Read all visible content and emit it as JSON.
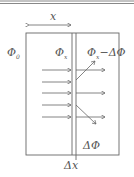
{
  "diagram": {
    "labels": {
      "x": "x",
      "phi0": "Φ",
      "phi0_sub": "0",
      "phix": "Φ",
      "phix_sub": "x",
      "phix_minus": "Φ",
      "phix_minus_sub": "x",
      "phix_minus_rest": "−ΔΦ",
      "delta_phi": "ΔΦ",
      "delta_x": "Δx"
    },
    "colors": {
      "stroke": "#6a6a6a",
      "text": "#555555"
    }
  }
}
